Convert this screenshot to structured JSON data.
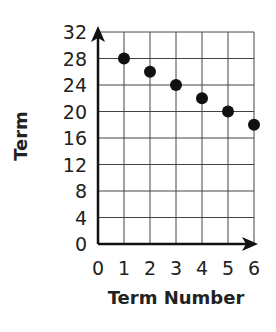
{
  "chart_data": {
    "type": "scatter",
    "title": "",
    "xlabel": "Term Number",
    "ylabel": "Term",
    "x": [
      1,
      2,
      3,
      4,
      5,
      6
    ],
    "y": [
      28,
      26,
      24,
      22,
      20,
      18
    ],
    "series": [
      {
        "name": "Terms",
        "x": [
          1,
          2,
          3,
          4,
          5,
          6
        ],
        "values": [
          28,
          26,
          24,
          22,
          20,
          18
        ]
      }
    ],
    "xlim": [
      0,
      6
    ],
    "ylim": [
      0,
      32
    ],
    "x_ticks": [
      "0",
      "1",
      "2",
      "3",
      "4",
      "5",
      "6"
    ],
    "y_ticks": [
      "0",
      "4",
      "8",
      "12",
      "16",
      "20",
      "24",
      "28",
      "32"
    ],
    "grid": true,
    "legend": null,
    "point_color": "#111111",
    "grid_color": "#444444"
  }
}
